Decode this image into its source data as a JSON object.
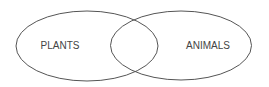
{
  "diagram": {
    "type": "venn",
    "sets": [
      {
        "label": "PLANTS"
      },
      {
        "label": "ANIMALS"
      }
    ],
    "intersection_label": "",
    "colors": {
      "stroke": "#555555",
      "text": "#444444",
      "background": "#ffffff"
    }
  }
}
